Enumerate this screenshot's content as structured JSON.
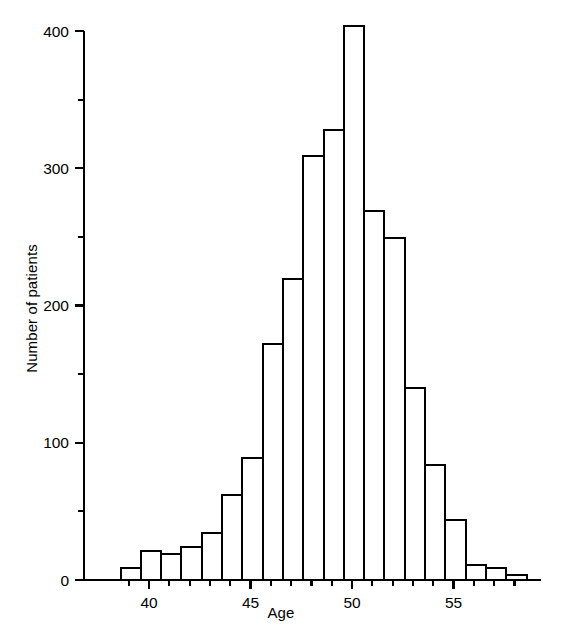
{
  "chart_data": {
    "type": "bar",
    "title": "",
    "subtitle": "",
    "xlabel": "Age",
    "ylabel": "Number of patients",
    "xlim": [
      38.2,
      58.9
    ],
    "ylim": [
      0,
      420
    ],
    "grid": false,
    "legend": null,
    "bin_width": 1,
    "x_tick_labels": [
      "40",
      "45",
      "50",
      "55"
    ],
    "x_tick_values": [
      40,
      45,
      50,
      55
    ],
    "x_minor_tick_interval": 1,
    "y_tick_labels": [
      "0",
      "100",
      "200",
      "300",
      "400"
    ],
    "y_tick_values": [
      0,
      100,
      200,
      300,
      400
    ],
    "y_minor_tick_interval": 50,
    "categories": [
      "38.6-39.6",
      "39.6-40.6",
      "40.6-41.6",
      "41.6-42.6",
      "42.6-43.6",
      "43.6-44.6",
      "44.6-45.6",
      "45.6-46.6",
      "46.6-47.6",
      "47.6-48.6",
      "48.6-49.6",
      "49.6-50.6",
      "50.6-51.6",
      "51.6-52.6",
      "52.6-53.6",
      "53.6-54.6",
      "54.6-55.6",
      "55.6-56.6",
      "56.6-57.6",
      "57.6-58.6"
    ],
    "bin_starts": [
      38.6,
      39.6,
      40.6,
      41.6,
      42.6,
      43.6,
      44.6,
      45.6,
      46.6,
      47.6,
      48.6,
      49.6,
      50.6,
      51.6,
      52.6,
      53.6,
      54.6,
      55.6,
      56.6,
      57.6
    ],
    "values": [
      9,
      21,
      19,
      24,
      34,
      62,
      89,
      172,
      219,
      309,
      328,
      404,
      269,
      249,
      140,
      84,
      44,
      11,
      9,
      4
    ],
    "colors": {
      "bar_fill": "#ffffff",
      "bar_stroke": "#000000",
      "axis": "#000000",
      "background": "#ffffff"
    }
  },
  "axes": {
    "x_axis_name": "Age",
    "y_axis_name": "Number of patients"
  }
}
